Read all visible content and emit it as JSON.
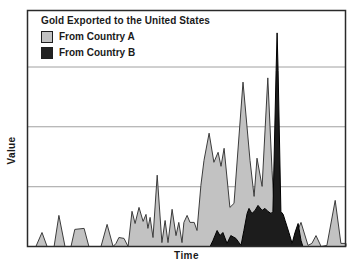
{
  "title": "Gold Exported to the United States",
  "legend": [
    {
      "label": "From Country A",
      "color": "#c2c2c2"
    },
    {
      "label": "From Country B",
      "color": "#222222"
    }
  ],
  "axes": {
    "x_label": "Time",
    "y_label": "Value"
  },
  "colors": {
    "country_a_fill": "#c2c2c2",
    "country_a_stroke": "#3c3c3c",
    "country_b_fill": "#1c1c1c",
    "country_b_stroke": "#000000",
    "gridline": "#a0a0a0",
    "border": "#2a2a2a",
    "plot_background": "#ffffff"
  },
  "chart_data": {
    "type": "area",
    "title": "Gold Exported to the United States",
    "xlabel": "Time",
    "ylabel": "Value",
    "x_range": [
      0,
      100
    ],
    "ylim": [
      0,
      100
    ],
    "gridlines_y": [
      33.3,
      66.7,
      100
    ],
    "grid": "horizontal-only",
    "legend_position": "top-left-inside",
    "axis_ticks": "none",
    "note": "Axes are unlabeled (qualitative Time/Value). Values normalized so the top gridline = 100; Country B's narrow spike overshoots to ~119, piercing the top gridline.",
    "series": [
      {
        "name": "From Country A",
        "points": [
          [
            0,
            0
          ],
          [
            2.8,
            0
          ],
          [
            4.7,
            7.8
          ],
          [
            6.3,
            0
          ],
          [
            8.5,
            0
          ],
          [
            10,
            17.3
          ],
          [
            11.9,
            0
          ],
          [
            13.8,
            0
          ],
          [
            15,
            9.5
          ],
          [
            17.9,
            10.1
          ],
          [
            19.4,
            0
          ],
          [
            23.2,
            0
          ],
          [
            25.1,
            12.3
          ],
          [
            27,
            0
          ],
          [
            27.9,
            1.7
          ],
          [
            28.8,
            5
          ],
          [
            30.4,
            4.5
          ],
          [
            31.7,
            0
          ],
          [
            32.9,
            19.6
          ],
          [
            33.9,
            12.8
          ],
          [
            35.1,
            21.8
          ],
          [
            36.4,
            14
          ],
          [
            37.3,
            17.9
          ],
          [
            37.9,
            10.1
          ],
          [
            38.6,
            16.2
          ],
          [
            39.5,
            5
          ],
          [
            40.8,
            39.7
          ],
          [
            42.3,
            2.2
          ],
          [
            43.3,
            14.5
          ],
          [
            44.2,
            2.2
          ],
          [
            45.5,
            20.7
          ],
          [
            46.7,
            6.1
          ],
          [
            47.6,
            13.4
          ],
          [
            48.6,
            2.2
          ],
          [
            49.2,
            13.4
          ],
          [
            50.2,
            17.3
          ],
          [
            51.1,
            13.4
          ],
          [
            52.4,
            13.4
          ],
          [
            53.3,
            8.9
          ],
          [
            54.5,
            34.1
          ],
          [
            55.5,
            48
          ],
          [
            57.1,
            63.1
          ],
          [
            58.6,
            46.9
          ],
          [
            59.9,
            52.5
          ],
          [
            60.8,
            44.7
          ],
          [
            61.8,
            54.7
          ],
          [
            63.6,
            21.8
          ],
          [
            64.9,
            24
          ],
          [
            67.7,
            91.6
          ],
          [
            69.9,
            48
          ],
          [
            71.2,
            27.9
          ],
          [
            72.1,
            49.2
          ],
          [
            73.7,
            33.5
          ],
          [
            75.5,
            93.9
          ],
          [
            76.8,
            42.5
          ],
          [
            77.7,
            14.5
          ],
          [
            78.7,
            3.4
          ],
          [
            79.9,
            0
          ],
          [
            83.4,
            0
          ],
          [
            84.6,
            7.8
          ],
          [
            85.9,
            13.4
          ],
          [
            88.1,
            0.6
          ],
          [
            89.3,
            1.7
          ],
          [
            90.6,
            6.1
          ],
          [
            92.2,
            0
          ],
          [
            94,
            0.6
          ],
          [
            96.6,
            25.7
          ],
          [
            98.4,
            1.7
          ],
          [
            100,
            1.7
          ]
        ]
      },
      {
        "name": "From Country B",
        "points": [
          [
            57.4,
            0
          ],
          [
            58.3,
            3.4
          ],
          [
            59.6,
            8.9
          ],
          [
            60.5,
            6.1
          ],
          [
            61.4,
            7.8
          ],
          [
            62.7,
            1.7
          ],
          [
            63.9,
            6.1
          ],
          [
            65.5,
            4.5
          ],
          [
            67.1,
            0.6
          ],
          [
            68,
            8.9
          ],
          [
            69,
            18.4
          ],
          [
            69.6,
            21.2
          ],
          [
            70.5,
            18.4
          ],
          [
            71.5,
            20.1
          ],
          [
            72.4,
            22.9
          ],
          [
            73.7,
            20.1
          ],
          [
            74.6,
            21.2
          ],
          [
            75.5,
            19.6
          ],
          [
            76.5,
            18.4
          ],
          [
            77.1,
            19.5
          ],
          [
            78.1,
            98
          ],
          [
            78.4,
            119
          ],
          [
            78.7,
            98
          ],
          [
            79.6,
            19.5
          ],
          [
            80.3,
            17.9
          ],
          [
            80.9,
            14.5
          ],
          [
            82.1,
            7.8
          ],
          [
            83.1,
            1.7
          ],
          [
            84,
            7.8
          ],
          [
            85,
            12.8
          ],
          [
            85.9,
            3.4
          ],
          [
            86.5,
            0
          ]
        ]
      }
    ]
  }
}
